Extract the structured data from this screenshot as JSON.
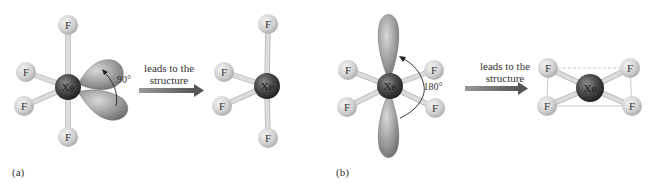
{
  "figure": {
    "panels": [
      {
        "label": "(a)",
        "central_atom": "Xe",
        "ligand": "F",
        "angle_label": "90°",
        "arrow_text_line1": "leads to the",
        "arrow_text_line2": "structure"
      },
      {
        "label": "(b)",
        "central_atom": "Xe",
        "ligand": "F",
        "angle_label": "180°",
        "arrow_text_line1": "leads to the",
        "arrow_text_line2": "structure"
      }
    ]
  },
  "colors": {
    "xenon": "#3c3c3c",
    "fluorine": "#d0d0d0",
    "lobe": "#8a8a8a",
    "arrow": "#707070"
  }
}
